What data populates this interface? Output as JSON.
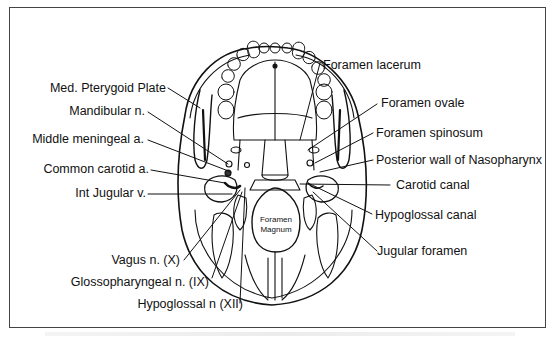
{
  "figure": {
    "left_labels": [
      {
        "id": "med-pterygoid-plate",
        "text": "Med. Pterygoid Plate"
      },
      {
        "id": "mandibular-n",
        "text": "Mandibular n."
      },
      {
        "id": "middle-meningeal-a",
        "text": "Middle meningeal a."
      },
      {
        "id": "common-carotid-a",
        "text": "Common carotid a."
      },
      {
        "id": "int-jugular-v",
        "text": "Int Jugular v."
      },
      {
        "id": "vagus-n",
        "text": "Vagus n. (X)"
      },
      {
        "id": "glossopharyngeal-n",
        "text": "Glossopharyngeal n. (IX)"
      },
      {
        "id": "hypoglossal-n",
        "text": "Hypoglossal n (XII)"
      }
    ],
    "right_labels": [
      {
        "id": "foramen-lacerum",
        "text": "Foramen lacerum"
      },
      {
        "id": "foramen-ovale",
        "text": "Foramen ovale"
      },
      {
        "id": "foramen-spinosum",
        "text": "Foramen spinosum"
      },
      {
        "id": "posterior-wall-nasopharynx",
        "text": "Posterior wall of Nasopharynx"
      },
      {
        "id": "carotid-canal",
        "text": "Carotid canal"
      },
      {
        "id": "hypoglossal-canal",
        "text": "Hypoglossal canal"
      },
      {
        "id": "jugular-foramen",
        "text": "Jugular foramen"
      }
    ],
    "center_label": {
      "line1": "Foramen",
      "line2": "Magnum"
    }
  },
  "colors": {
    "line": "#111111",
    "frame": "#444444",
    "background": "#ffffff"
  }
}
